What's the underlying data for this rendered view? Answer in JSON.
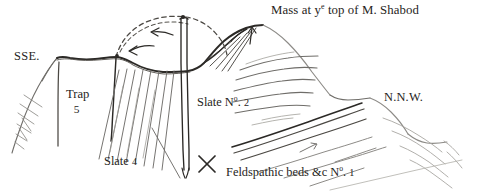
{
  "figure": {
    "kind": "geological-cross-section-sketch",
    "orientation_left": "SSE.",
    "orientation_right": "N.N.W.",
    "ink_color": "#2b2926",
    "faint_ink_color": "#8d8b87",
    "background_color": "#ffffff"
  },
  "labels": {
    "mass_shabod": {
      "prefix": "Mass at y",
      "superscript": "e",
      "suffix": " top of M. Shabod",
      "full": "Mass at ye top of M. Shabod"
    },
    "sse": "SSE.",
    "nnw": "N.N.W.",
    "trap": {
      "name": "Trap",
      "number": "5"
    },
    "slate4": "Slate 4",
    "slate4_parts": {
      "name": "Slate",
      "number": "4"
    },
    "slate2_parts": {
      "name": "Slate N",
      "superscript": "o",
      "suffix": ". ",
      "number": "2"
    },
    "feldspathic_parts": {
      "name": "Feldspathic beds &c N",
      "superscript": "o",
      "suffix": ". ",
      "number": "1"
    }
  },
  "annotations": {
    "fault_mark": "✕",
    "arrow_direction_dashed_arch": "left",
    "arrow_direction_peak": "up",
    "dashed_arch_meaning": "former eroded continuation of arch"
  }
}
